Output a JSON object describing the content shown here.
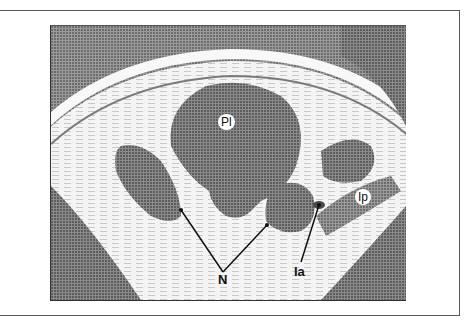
{
  "figure": {
    "type": "CT scan cross-section",
    "labels": {
      "pi": "Pl",
      "n": "N",
      "ia": "Ia",
      "ip": "Ip"
    }
  }
}
